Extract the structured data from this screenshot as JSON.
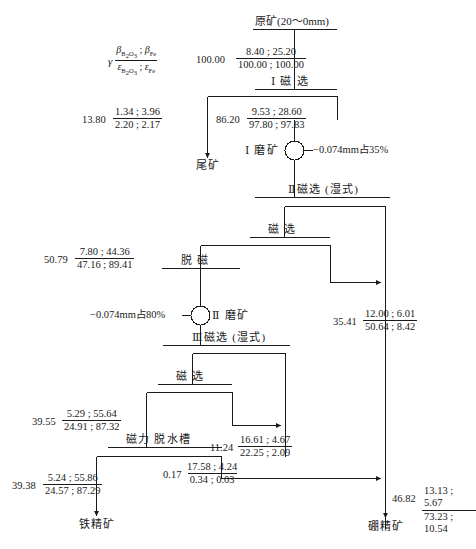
{
  "diagram": {
    "kind": "mineral-processing-flowsheet",
    "legend": {
      "gamma": "γ",
      "numerator": "βB2O3 ; βFe",
      "denominator": "εB2O3 ; εFe"
    },
    "feed": {
      "label": "原矿(20～0mm)"
    },
    "operations": {
      "mag1": "Ⅰ 磁 选",
      "mill1": "Ⅰ 磨矿",
      "mag2": "Ⅱ磁选 (湿式)",
      "mag_sep_mid": "磁 选",
      "demag": "脱 磁",
      "mill2": "Ⅱ 磨矿",
      "mag3": "Ⅲ磁选 (湿式)",
      "mag_sep_low": "磁 选",
      "dewater": "磁力 脱水槽"
    },
    "products": {
      "tailings": "尾矿",
      "iron_concentrate": "铁精矿",
      "boron_concentrate": "硼精矿"
    },
    "notes": {
      "mill1_fineness": "−0.074mm占35%",
      "mill2_fineness": "−0.074mm占80%"
    },
    "streams": [
      {
        "id": "feed",
        "gamma": "100.00",
        "num": "8.40 ; 25.20",
        "den": "100.00 ; 100.00"
      },
      {
        "id": "mag1-tail",
        "gamma": "13.80",
        "num": "1.34 ; 3.96",
        "den": "2.20 ; 2.17"
      },
      {
        "id": "mag1-conc",
        "gamma": "86.20",
        "num": "9.53 ; 28.60",
        "den": "97.80 ; 97.83"
      },
      {
        "id": "mid-mag",
        "gamma": "50.79",
        "num": "7.80 ; 44.36",
        "den": "47.16 ; 89.41"
      },
      {
        "id": "mag2-right",
        "gamma": "35.41",
        "num": "12.00 ; 6.01",
        "den": "50.64 ; 8.42"
      },
      {
        "id": "low-mag",
        "gamma": "39.55",
        "num": "5.29 ; 55.64",
        "den": "24.91 ; 87.32"
      },
      {
        "id": "mag3-right",
        "gamma": "11.24",
        "num": "16.61 ; 4.67",
        "den": "22.25 ; 2.09"
      },
      {
        "id": "dewater-of",
        "gamma": "0.17",
        "num": "17.58 ; 4.24",
        "den": "0.34 ; 0.03"
      },
      {
        "id": "iron-conc",
        "gamma": "39.38",
        "num": "5.24 ; 55.86",
        "den": "24.57 ; 87.29"
      },
      {
        "id": "boron-conc",
        "gamma": "46.82",
        "num": "13.13 ; 5.67",
        "den": "73.23 ; 10.54"
      }
    ]
  }
}
